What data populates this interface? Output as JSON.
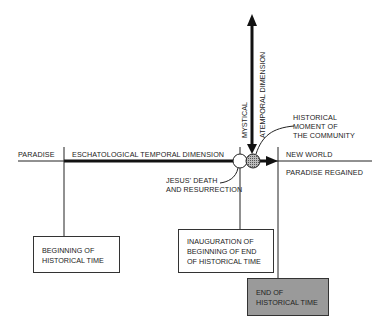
{
  "diagram": {
    "horizontal_axis": {
      "left_label": "PARADISE",
      "arrow_label": "ESCHATOLOGICAL TEMPORAL DIMENSION",
      "right_label_top": "NEW WORLD",
      "right_label_bottom": "PARADISE REGAINED"
    },
    "vertical_axis": {
      "label_left": "MYSTICAL",
      "label_right": "ATEMPORAL DIMENSION"
    },
    "annotations": {
      "historical_moment": [
        "HISTORICAL",
        "MOMENT OF",
        "THE COMMUNITY"
      ],
      "jesus": [
        "JESUS' DEATH",
        "AND RESURRECTION"
      ]
    },
    "boxes": [
      {
        "id": "beginning",
        "lines": [
          "BEGINNING OF",
          "HISTORICAL TIME"
        ],
        "shaded": false
      },
      {
        "id": "inauguration",
        "lines": [
          "INAUGURATION OF",
          "BEGINNING OF END",
          "OF HISTORICAL TIME"
        ],
        "shaded": false
      },
      {
        "id": "end",
        "lines": [
          "END OF",
          "HISTORICAL TIME"
        ],
        "shaded": true
      }
    ],
    "colors": {
      "line": "#222222",
      "shaded_box": "#9a9a9a",
      "hatched_circle": "#888888"
    }
  }
}
